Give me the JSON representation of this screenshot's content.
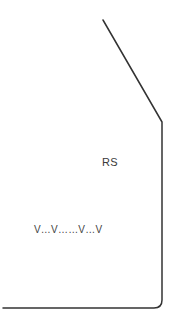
{
  "diagram": {
    "outline": {
      "stroke_color": "#333333",
      "stroke_width": 1.5,
      "points": {
        "diagonal_start": [
          103,
          20
        ],
        "diagonal_end": [
          162,
          122
        ],
        "vertical_end": [
          162,
          300
        ],
        "corner_radius": 7,
        "bottom_end": [
          3,
          308
        ]
      }
    },
    "labels": {
      "region_label": "RS",
      "marks_row": "V…V……V…V"
    }
  }
}
